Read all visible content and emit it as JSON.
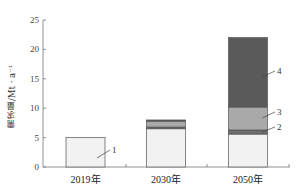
{
  "chart_data": {
    "type": "bar",
    "stacked": true,
    "title": "",
    "xlabel": "",
    "ylabel": "需求量/Mt · a⁻¹",
    "ylim": [
      0,
      25
    ],
    "yticks": [
      0,
      5,
      10,
      15,
      20,
      25
    ],
    "categories": [
      "2019年",
      "2030年",
      "2050年"
    ],
    "series": [
      {
        "name": "1",
        "color": "#f2f2f2",
        "values": [
          5.0,
          6.5,
          5.6
        ]
      },
      {
        "name": "2",
        "color": "#6e6e6e",
        "values": [
          0,
          0.3,
          0.7
        ]
      },
      {
        "name": "3",
        "color": "#a9a9a9",
        "values": [
          0,
          1.0,
          3.9
        ]
      },
      {
        "name": "4",
        "color": "#5a5a5a",
        "values": [
          0,
          0.2,
          11.8
        ]
      }
    ],
    "totals": [
      5.0,
      8.0,
      22.0
    ],
    "annotations": [
      {
        "text": "1",
        "bar": "2019年",
        "series": "1"
      },
      {
        "text": "2",
        "bar": "2050年",
        "series": "2"
      },
      {
        "text": "3",
        "bar": "2050年",
        "series": "3"
      },
      {
        "text": "4",
        "bar": "2050年",
        "series": "4"
      }
    ],
    "grid": false,
    "legend": "none (leader-line labels 1–4)"
  }
}
